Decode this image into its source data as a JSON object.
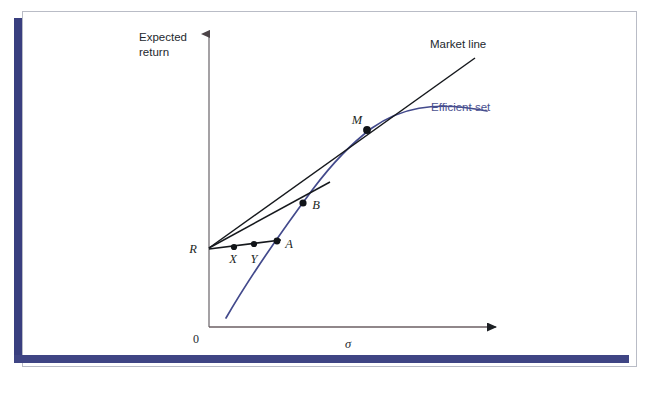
{
  "figure": {
    "axes": {
      "y_axis_label_line1": "Expected",
      "y_axis_label_line2": "return",
      "x_axis_label": "σ",
      "origin_label": "0"
    },
    "legend": [
      {
        "key": "market_line",
        "label": "Market line",
        "color": "#1b1f24"
      },
      {
        "key": "efficient_set",
        "label": "Efficient set",
        "color": "#4a5190"
      }
    ],
    "points": [
      {
        "key": "R",
        "label": "R",
        "x": 209,
        "y": 248,
        "marker": false,
        "label_dx": -14,
        "label_dy": 4
      },
      {
        "key": "X",
        "label": "X",
        "x": 234,
        "y": 247,
        "marker": true,
        "label_dx": -4,
        "label_dy": 15
      },
      {
        "key": "Y",
        "label": "Y",
        "x": 254,
        "y": 244,
        "marker": true,
        "label_dx": -4,
        "label_dy": 18
      },
      {
        "key": "A",
        "label": "A",
        "x": 277,
        "y": 241,
        "marker": true,
        "label_dx": 8,
        "label_dy": 6
      },
      {
        "key": "B",
        "label": "B",
        "x": 303,
        "y": 203,
        "marker": true,
        "label_dx": 9,
        "label_dy": 5
      },
      {
        "key": "M",
        "label": "M",
        "x": 367,
        "y": 130,
        "marker": true,
        "label_dx": -14,
        "label_dy": -6
      }
    ],
    "colors": {
      "axis": "#6b5f63",
      "market_line": "#16191d",
      "chord_line": "#16191d",
      "efficient_set": "#434a8c",
      "frame_accent": "#393f7f",
      "frame_thin": "#b9bcc6",
      "background": "#ffffff"
    },
    "geometry": {
      "y_axis_x": 209,
      "y_axis_top": 30,
      "x_axis_y": 327,
      "x_axis_right": 505,
      "market_line_end_x": 475,
      "market_line_end_y": 58,
      "efficient_set_start_x": 226,
      "efficient_set_start_y": 318,
      "efficient_set_end_x": 487,
      "efficient_set_end_y": 111
    },
    "caption": "Capital market line diagram: risk-free rate R, portfolios X, Y, A, B and tangency portfolio M on the efficient set."
  }
}
